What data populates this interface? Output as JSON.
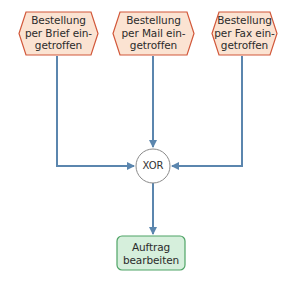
{
  "diagram": {
    "type": "EPC (Ereignisgesteuerte Prozesskette)",
    "colors": {
      "event_fill": "#fbe3d2",
      "event_stroke": "#d2583a",
      "function_fill": "#d6efdc",
      "function_stroke": "#4fa466",
      "connector_fill": "#ffffff",
      "connector_stroke": "#8a8a8a",
      "arrow": "#5b86ae"
    },
    "events": [
      {
        "id": "event-brief",
        "label": "Bestellung\nper Brief ein-\ngetroffen"
      },
      {
        "id": "event-mail",
        "label": "Bestellung\nper Mail ein-\ngetroffen"
      },
      {
        "id": "event-fax",
        "label": "Bestellung\nper Fax ein-\ngetroffen"
      }
    ],
    "connector": {
      "id": "xor",
      "label": "XOR"
    },
    "function": {
      "id": "function-auftrag",
      "label": "Auftrag\nbearbeiten"
    },
    "edges": [
      {
        "from": "event-brief",
        "to": "xor"
      },
      {
        "from": "event-mail",
        "to": "xor"
      },
      {
        "from": "event-fax",
        "to": "xor"
      },
      {
        "from": "xor",
        "to": "function-auftrag"
      }
    ]
  }
}
